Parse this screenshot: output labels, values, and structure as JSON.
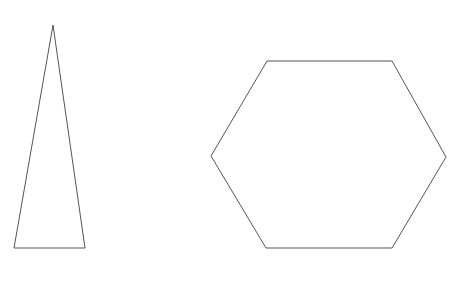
{
  "canvas": {
    "width": 456,
    "height": 282,
    "background_color": "#ffffff",
    "title": "Geometric Shapes"
  },
  "style": {
    "stroke_color": "#555555",
    "stroke_width": 1,
    "fill": "none"
  },
  "shapes": [
    {
      "id": "triangle",
      "name": "isosceles-triangle",
      "label": "Triangle",
      "sides": 3,
      "fill": "none",
      "stroke_color": "#555555",
      "stroke_width": 1,
      "points": "53,25 85,248 14,248",
      "vertices": [
        {
          "x": 53,
          "y": 25
        },
        {
          "x": 85,
          "y": 248
        },
        {
          "x": 14,
          "y": 248
        }
      ],
      "bounds": {
        "x": 14,
        "y": 25,
        "width": 71,
        "height": 223
      }
    },
    {
      "id": "hexagon",
      "name": "regular-hexagon",
      "label": "Hexagon",
      "sides": 6,
      "fill": "none",
      "stroke_color": "#555555",
      "stroke_width": 1,
      "points": "267,61 392,61 446,157 392,248 266,248 211,156",
      "vertices": [
        {
          "x": 267,
          "y": 61
        },
        {
          "x": 392,
          "y": 61
        },
        {
          "x": 446,
          "y": 157
        },
        {
          "x": 392,
          "y": 248
        },
        {
          "x": 266,
          "y": 248
        },
        {
          "x": 211,
          "y": 156
        }
      ],
      "bounds": {
        "x": 211,
        "y": 61,
        "width": 235,
        "height": 187
      }
    }
  ]
}
